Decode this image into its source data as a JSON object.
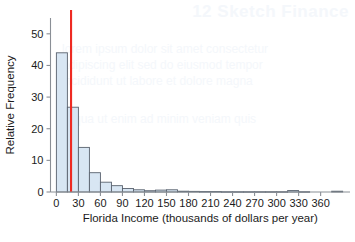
{
  "figure": {
    "background_color": "#ffffff",
    "bar_fill_color": "#d8e6f3",
    "bar_edge_color": "#59626e",
    "mean_line_color": "#ee2a22",
    "axis_color": "#8a8f96",
    "text_color": "#1b1b1b"
  },
  "watermark": {
    "title": "12  Sketch Finance",
    "line1": "lorem ipsum dolor sit amet consectetur",
    "line2": "adipiscing elit sed do eiusmod tempor",
    "line3": "incididunt ut labore et dolore magna",
    "line4": "aliqua ut enim ad minim veniam quis"
  },
  "chart_data": {
    "type": "bar",
    "title": "",
    "subtitle": "",
    "xlabel": "Florida Income (thousands of dollars per year)",
    "ylabel": "Relative Frequency",
    "xlim": [
      -8,
      400
    ],
    "ylim": [
      0,
      55
    ],
    "xticks": [
      0,
      30,
      60,
      90,
      120,
      150,
      180,
      210,
      240,
      270,
      300,
      330,
      360
    ],
    "xtick_labels": [
      "0",
      "30",
      "60",
      "90",
      "120",
      "150",
      "180",
      "210",
      "240",
      "270",
      "300",
      "330",
      "360"
    ],
    "yticks": [
      0,
      10,
      20,
      30,
      40,
      50
    ],
    "ytick_labels": [
      "0",
      "10",
      "20",
      "30",
      "40",
      "50"
    ],
    "grid": false,
    "legend": null,
    "bin_width": 15,
    "bin_starts": [
      0,
      15,
      30,
      45,
      60,
      75,
      90,
      105,
      120,
      135,
      150,
      165,
      180,
      195,
      210,
      225,
      240,
      255,
      270,
      285,
      300,
      315,
      330,
      345,
      360,
      375
    ],
    "values": [
      44,
      26.8,
      14.1,
      6.1,
      3.1,
      2.0,
      1.1,
      0.7,
      0.4,
      0.6,
      0.7,
      0.25,
      0.2,
      0.15,
      0.15,
      0.1,
      0.1,
      0.1,
      0.1,
      0.1,
      0.1,
      0.45,
      0.1,
      0.0,
      0.0,
      0.25
    ],
    "annotations": [
      {
        "name": "mean-line",
        "type": "vline",
        "x": 20,
        "color": "#ee2a22",
        "label": ""
      }
    ]
  }
}
